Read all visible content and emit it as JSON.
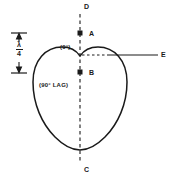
{
  "figure": {
    "background_color": "#ffffff",
    "line_color": "#1a1a1a",
    "width": 176,
    "height": 179
  },
  "labels": {
    "top_axis": "D",
    "bottom_axis": "C",
    "upper_point": "A",
    "lower_point": "B",
    "right_axis": "E",
    "phase_zero": "(0°)",
    "phase_lag": "(90° LAG)"
  },
  "dimension": {
    "numerator": "λ",
    "denominator": "4",
    "label": "λ/4"
  },
  "geometry": {
    "vertical_axis_x": 80,
    "vertical_axis_top": 14,
    "vertical_axis_bottom": 163,
    "horizontal_line_y": 55,
    "horizontal_line_start_x": 108,
    "horizontal_line_end_x": 158,
    "dashed_segment_start_x": 82,
    "dashed_segment_end_x": 108,
    "point_a": {
      "x": 80,
      "y": 33
    },
    "point_b": {
      "x": 80,
      "y": 72
    },
    "dimension_marker_x": 19,
    "dimension_marker_top": 33,
    "dimension_marker_bottom": 73
  }
}
